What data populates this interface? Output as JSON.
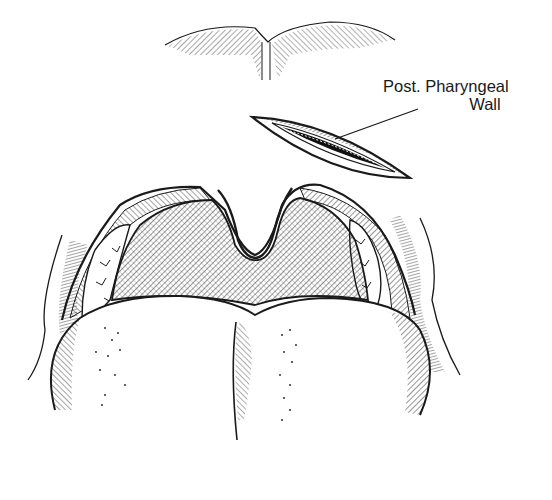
{
  "figure": {
    "type": "medical-line-illustration",
    "labels": [
      {
        "id": "post-pharyngeal-wall",
        "line1": "Post. Pharyngeal",
        "line2": "Wall",
        "points_to": "incision-inset"
      }
    ],
    "colors": {
      "ink": "#1a1a1a",
      "background": "#ffffff"
    }
  }
}
